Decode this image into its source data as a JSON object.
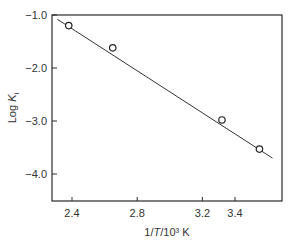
{
  "chart_data": {
    "type": "scatter",
    "title": "",
    "xlabel": "1/T/10³ K",
    "ylabel": "Log K_i",
    "xlim": [
      2.2,
      3.72
    ],
    "ylim": [
      -4.5,
      -1.0
    ],
    "grid": false,
    "legend": null,
    "x_ticks": [
      {
        "value": 2.4,
        "label": "2.4"
      },
      {
        "value": 2.8,
        "label": "2.8"
      },
      {
        "value": 3.2,
        "label": "3.2"
      },
      {
        "value": 3.4,
        "label": "3.4"
      }
    ],
    "y_ticks": [
      {
        "value": -1.0,
        "label": "−1.0"
      },
      {
        "value": -2.0,
        "label": "−2.0"
      },
      {
        "value": -3.0,
        "label": "−3.0"
      },
      {
        "value": -4.0,
        "label": "−4.0"
      }
    ],
    "series": [
      {
        "name": "data",
        "marker": "open-circle",
        "points": [
          {
            "x": 2.38,
            "y": -1.2
          },
          {
            "x": 2.65,
            "y": -1.62
          },
          {
            "x": 3.32,
            "y": -2.98
          },
          {
            "x": 3.55,
            "y": -3.53
          }
        ]
      }
    ],
    "fit_line": {
      "x1": 2.31,
      "y1": -1.08,
      "x2": 3.63,
      "y2": -3.7
    }
  },
  "labels": {
    "xlabel_prefix": "1/",
    "xlabel_italic": "T",
    "xlabel_suffix": "/10³ K",
    "ylabel_main": "Log ",
    "ylabel_italic": "K",
    "ylabel_sub": "i"
  }
}
